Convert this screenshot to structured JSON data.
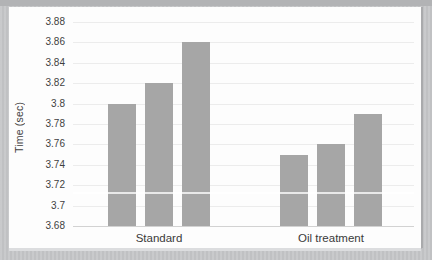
{
  "chart_data": {
    "type": "bar",
    "title": "",
    "ylabel": "Time (sec)",
    "xlabel": "",
    "ylim": [
      3.68,
      3.88
    ],
    "grid": true,
    "legend": "none",
    "bar_color": "#a6a6a6",
    "yticks": [
      "3.88",
      "3.86",
      "3.84",
      "3.82",
      "3.8",
      "3.78",
      "3.76",
      "3.74",
      "3.72",
      "3.7",
      "3.68"
    ],
    "categories": [
      "Standard",
      "Oil treatment"
    ],
    "groups": [
      {
        "category": "Standard",
        "values": [
          3.8,
          3.82,
          3.86
        ]
      },
      {
        "category": "Oil treatment",
        "values": [
          3.75,
          3.76,
          3.79
        ]
      }
    ]
  }
}
